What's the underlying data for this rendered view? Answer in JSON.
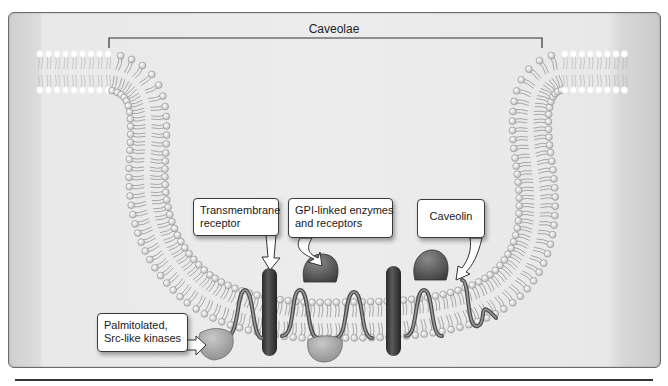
{
  "figure": {
    "title": "Caveolae",
    "labels": {
      "transmembrane": {
        "line1": "Transmembrane",
        "line2": "receptor"
      },
      "gpi": {
        "line1": "GPI-linked enzymes",
        "line2": "and receptors"
      },
      "caveolin": {
        "line1": "Caveolin"
      },
      "palmitolated": {
        "line1": "Palmitolated,",
        "line2": "Src-like kinases"
      }
    },
    "components": [
      {
        "name": "lipid-bilayer",
        "shape": "U-shaped invagination"
      },
      {
        "name": "transmembrane-receptor",
        "count": 2
      },
      {
        "name": "gpi-linked-protein",
        "count": 2
      },
      {
        "name": "caveolin-hairpin",
        "count": 5
      },
      {
        "name": "palmitolated-kinase",
        "count": 2
      }
    ],
    "colors": {
      "background": "#ececec",
      "lipid_head": "#f5f5f5",
      "lipid_tail": "#8a8a8a",
      "receptor": "#3a3a3a",
      "gpi_protein": "#555555",
      "caveolin": "#6a6a6a",
      "kinase": "#9a9a9a"
    }
  }
}
